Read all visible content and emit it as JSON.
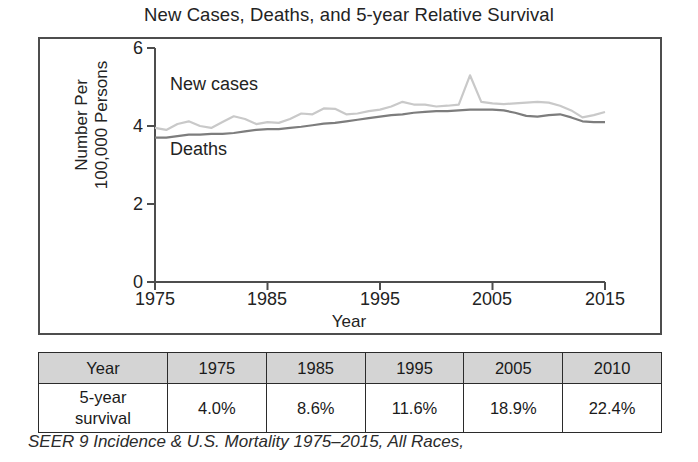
{
  "chart_data": {
    "type": "line",
    "title": "New Cases, Deaths, and 5-year Relative Survival",
    "xlabel": "Year",
    "ylabel": "Number Per 100,000 Persons",
    "xlim": [
      1975,
      2015
    ],
    "ylim": [
      0,
      6
    ],
    "xticks": [
      1975,
      1985,
      1995,
      2005,
      2015
    ],
    "yticks": [
      0,
      2,
      4,
      6
    ],
    "grid": false,
    "legend_position": "inline-labels",
    "series": [
      {
        "name": "New cases",
        "color": "#c9c9c9",
        "x": [
          1975,
          1976,
          1977,
          1978,
          1979,
          1980,
          1981,
          1982,
          1983,
          1984,
          1985,
          1986,
          1987,
          1988,
          1989,
          1990,
          1991,
          1992,
          1993,
          1994,
          1995,
          1996,
          1997,
          1998,
          1999,
          2000,
          2001,
          2002,
          2003,
          2004,
          2005,
          2006,
          2007,
          2008,
          2009,
          2010,
          2011,
          2012,
          2013,
          2014,
          2015
        ],
        "values": [
          3.95,
          3.9,
          4.05,
          4.12,
          4.0,
          3.95,
          4.1,
          4.25,
          4.18,
          4.05,
          4.1,
          4.08,
          4.18,
          4.32,
          4.3,
          4.45,
          4.44,
          4.3,
          4.32,
          4.38,
          4.42,
          4.5,
          4.62,
          4.55,
          4.55,
          4.5,
          4.52,
          4.55,
          5.3,
          4.62,
          4.58,
          4.56,
          4.58,
          4.6,
          4.62,
          4.6,
          4.52,
          4.4,
          4.22,
          4.28,
          4.36
        ]
      },
      {
        "name": "Deaths",
        "color": "#7d7d7d",
        "x": [
          1975,
          1976,
          1977,
          1978,
          1979,
          1980,
          1981,
          1982,
          1983,
          1984,
          1985,
          1986,
          1987,
          1988,
          1989,
          1990,
          1991,
          1992,
          1993,
          1994,
          1995,
          1996,
          1997,
          1998,
          1999,
          2000,
          2001,
          2002,
          2003,
          2004,
          2005,
          2006,
          2007,
          2008,
          2009,
          2010,
          2011,
          2012,
          2013,
          2014,
          2015
        ],
        "values": [
          3.7,
          3.7,
          3.74,
          3.78,
          3.78,
          3.8,
          3.8,
          3.82,
          3.86,
          3.9,
          3.92,
          3.92,
          3.95,
          3.98,
          4.02,
          4.06,
          4.08,
          4.12,
          4.16,
          4.2,
          4.24,
          4.28,
          4.3,
          4.34,
          4.36,
          4.38,
          4.38,
          4.4,
          4.42,
          4.42,
          4.42,
          4.4,
          4.34,
          4.26,
          4.24,
          4.28,
          4.3,
          4.22,
          4.12,
          4.1,
          4.1
        ]
      }
    ],
    "annotations": [
      {
        "text": "New cases",
        "x": 1976,
        "y": 5.15
      },
      {
        "text": "Deaths",
        "x": 1976,
        "y": 3.35
      }
    ]
  },
  "title": "New Cases, Deaths, and 5-year Relative Survival",
  "axes": {
    "y_title_line1": "Number Per",
    "y_title_line2": "100,000 Persons",
    "x_title": "Year",
    "y_ticks": [
      "6",
      "4",
      "2",
      "0"
    ],
    "x_ticks": [
      "1975",
      "1985",
      "1995",
      "2005",
      "2015"
    ]
  },
  "series_labels": {
    "new_cases": "New cases",
    "deaths": "Deaths"
  },
  "table": {
    "header": [
      "Year",
      "1975",
      "1985",
      "1995",
      "2005",
      "2010"
    ],
    "rows": [
      {
        "label": "5-year survival",
        "label_line1": "5-year",
        "label_line2": "survival",
        "values": [
          "4.0%",
          "8.6%",
          "11.6%",
          "18.9%",
          "22.4%"
        ]
      }
    ]
  },
  "caption": "SEER 9 Incidence & U.S. Mortality 1975–2015, All Races,",
  "colors": {
    "new_cases_line": "#c9c9c9",
    "deaths_line": "#7d7d7d",
    "table_header_bg": "#d4d4d4",
    "axis": "#4d4d4d"
  }
}
